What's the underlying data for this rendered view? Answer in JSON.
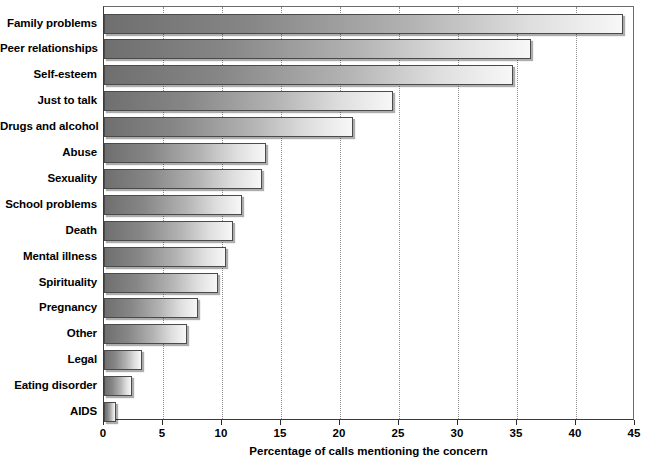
{
  "chart_data": {
    "type": "bar",
    "orientation": "horizontal",
    "title": "",
    "subtitle": "",
    "xlabel": "Percentage of calls mentioning the concern",
    "ylabel": "",
    "xlim": [
      0,
      45
    ],
    "xticks": [
      0,
      5,
      10,
      15,
      20,
      25,
      30,
      35,
      40,
      45
    ],
    "xticklabels": [
      "0",
      "5",
      "10",
      "15",
      "20",
      "25",
      "30",
      "35",
      "40",
      "45"
    ],
    "grid": "vertical-dotted",
    "legend": "none",
    "categories": [
      "Family problems",
      "Peer relationships",
      "Self-esteem",
      "Just to talk",
      "Drugs and alcohol",
      "Abuse",
      "Sexuality",
      "School problems",
      "Death",
      "Mental illness",
      "Spirituality",
      "Pregnancy",
      "Other",
      "Legal",
      "Eating disorder",
      "AIDS"
    ],
    "values": [
      44.0,
      36.2,
      34.7,
      24.5,
      21.1,
      13.7,
      13.4,
      11.7,
      10.9,
      10.3,
      9.7,
      8.0,
      7.0,
      3.2,
      2.4,
      1.0
    ],
    "bar_fill_start_color": "#6f6f6f",
    "bar_fill_end_color": "#f7f7f7",
    "bar_border_color": "#4a4a4a",
    "gridline_color": "#8d8d8d",
    "axis_color": "#3a3a3a",
    "background_color": "#ffffff"
  }
}
